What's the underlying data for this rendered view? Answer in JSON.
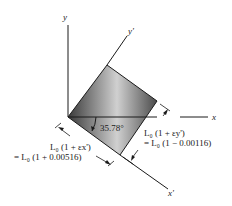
{
  "diagram": {
    "axes": {
      "x": "x",
      "y": "y",
      "x_prime": "x'",
      "y_prime": "y'"
    },
    "angle_label": "35.78°",
    "dimension_x_prime": {
      "line1": "L₀ (1 + εx')",
      "line2": "= L₀ (1 + 0.00516)"
    },
    "dimension_y_prime": {
      "line1": "L₀ (1 + εy')",
      "line2": "= L₀ (1 − 0.00116)"
    },
    "colors": {
      "line": "#1a1a1a",
      "fill_dark": "#3a3a3a",
      "fill_light": "#c8c8c8"
    }
  }
}
